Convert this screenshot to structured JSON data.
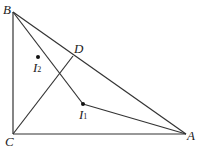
{
  "points": {
    "B": {
      "label": "B",
      "x": 13,
      "y": 12
    },
    "C": {
      "label": "C",
      "x": 13,
      "y": 134
    },
    "A": {
      "label": "A",
      "x": 186,
      "y": 134
    },
    "D": {
      "label": "D",
      "x": 73,
      "y": 56
    },
    "I1": {
      "label": "I",
      "sub": "1",
      "x": 83,
      "y": 104
    },
    "I2": {
      "label": "I",
      "sub": "2",
      "x": 38,
      "y": 57
    }
  },
  "colors": {
    "stroke": "#333333"
  }
}
